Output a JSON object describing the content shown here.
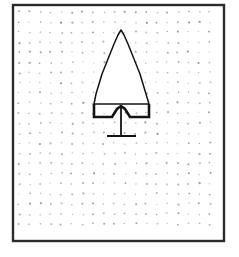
{
  "figure": {
    "background_color": "#ffffff",
    "canvas": {
      "width": 239,
      "height": 257
    }
  },
  "frame": {
    "name": "rectangular-border",
    "x": 13,
    "y": 5,
    "width": 211,
    "height": 236,
    "stroke_color": "#2b2b2b",
    "stroke_width": 2.4,
    "fill": "none"
  },
  "grid": {
    "name": "dotted-stipple-grid",
    "dot_color": "#8d8d8d",
    "dot_radius": 0.85,
    "spacing_x": 10.6,
    "spacing_y": 10.1,
    "origin_x": 19,
    "origin_y": 12,
    "columns": 19,
    "rows": 22,
    "jitter": 0.9
  },
  "drawing": {
    "name": "projectile-point",
    "stroke_color": "#141414",
    "fill": "#ffffff",
    "blade": {
      "name": "triangular-blade",
      "apex": {
        "x": 121,
        "y": 30
      },
      "left_base": {
        "x": 94,
        "y": 104
      },
      "right_base": {
        "x": 149,
        "y": 104
      },
      "stroke_width": 1.5,
      "outline": "M121,30 L118,35 L114,44 L110,54 L106,64 L102,74 L99,84 L96,94 L94,104 L149,104 L146,94 L143,84 L140,74 L136,64 L132,54 L128,44 L124,35 Z"
    },
    "tang": {
      "name": "notched-base",
      "stroke_width": 2.6,
      "notch_apex": {
        "x": 121,
        "y": 106
      },
      "base_line_y": 117,
      "left_x": 94,
      "right_x": 149,
      "outline": "M94,104 L94,117 L112,117 L117,109 L121,106 L125,109 L130,117 L149,117 L149,104"
    },
    "shaft": {
      "name": "vertical-shaft",
      "x": 121,
      "y_top": 108,
      "y_bottom": 136,
      "stroke_width": 1.8
    },
    "crossbar": {
      "name": "horizontal-crossbar",
      "y": 136,
      "x_start": 107,
      "x_end": 136,
      "stroke_width": 2.0
    }
  }
}
